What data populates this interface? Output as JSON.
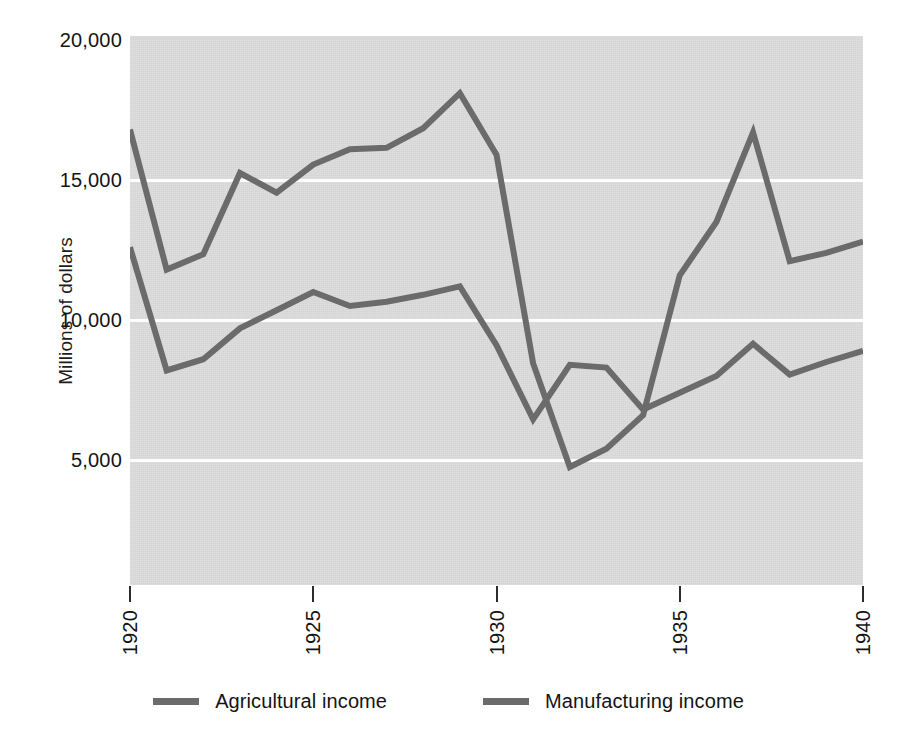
{
  "chart_data": {
    "type": "line",
    "title": "",
    "xlabel": "",
    "ylabel": "Millions of dollars",
    "x": [
      1920,
      1921,
      1922,
      1923,
      1924,
      1925,
      1926,
      1927,
      1928,
      1929,
      1930,
      1931,
      1932,
      1933,
      1934,
      1935,
      1936,
      1937,
      1938,
      1939,
      1940
    ],
    "xlim": [
      1920,
      1940
    ],
    "ylim": [
      0,
      20000
    ],
    "xticks": [
      1920,
      1925,
      1930,
      1935,
      1940
    ],
    "xtick_labels": [
      "1920",
      "1925",
      "1930",
      "1935",
      "1940"
    ],
    "yticks": [
      5000,
      10000,
      15000,
      20000
    ],
    "ytick_labels": [
      "5,000",
      "10,000",
      "15,000",
      "20,000"
    ],
    "grid": true,
    "grid_color": "#fdfdfd",
    "plot_background": "#dcdcdc",
    "line_color": "#6b6b6b",
    "legend_position": "bottom",
    "series": [
      {
        "name": "Agricultural income",
        "color": "#6b6b6b",
        "values": [
          16800,
          11800,
          12350,
          15250,
          14550,
          15550,
          16100,
          16150,
          16850,
          18100,
          15900,
          8450,
          4750,
          5400,
          6600,
          11600,
          13500,
          16700,
          12100,
          12400,
          12800
        ]
      },
      {
        "name": "Manufacturing income",
        "color": "#6b6b6b",
        "values": [
          12600,
          8200,
          8600,
          9700,
          10350,
          11000,
          10500,
          10650,
          10900,
          11200,
          9100,
          6450,
          8400,
          8300,
          6800,
          7400,
          8000,
          9150,
          8050,
          8500,
          8900
        ]
      }
    ]
  },
  "legend": {
    "entries": [
      {
        "label": "Agricultural income"
      },
      {
        "label": "Manufacturing income"
      }
    ]
  }
}
